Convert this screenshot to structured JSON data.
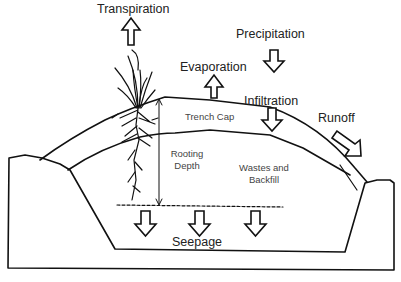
{
  "diagram": {
    "labels": {
      "transpiration": "Transpiration",
      "precipitation": "Precipitation",
      "evaporation": "Evaporation",
      "infiltration": "Infiltration",
      "runoff": "Runoff",
      "trench_cap": "Trench Cap",
      "rooting_depth_line1": "Rooting",
      "rooting_depth_line2": "Depth",
      "wastes_line1": "Wastes and",
      "wastes_line2": "Backfill",
      "seepage": "Seepage"
    },
    "arrows": [
      {
        "name": "transpiration",
        "direction": "up"
      },
      {
        "name": "precipitation",
        "direction": "down"
      },
      {
        "name": "evaporation",
        "direction": "up"
      },
      {
        "name": "infiltration",
        "direction": "down"
      },
      {
        "name": "runoff",
        "direction": "down-right"
      },
      {
        "name": "seepage-1",
        "direction": "down"
      },
      {
        "name": "seepage-2",
        "direction": "down"
      },
      {
        "name": "seepage-3",
        "direction": "down"
      }
    ],
    "colors": {
      "stroke": "#111111",
      "background": "#ffffff",
      "text": "#222222"
    }
  }
}
